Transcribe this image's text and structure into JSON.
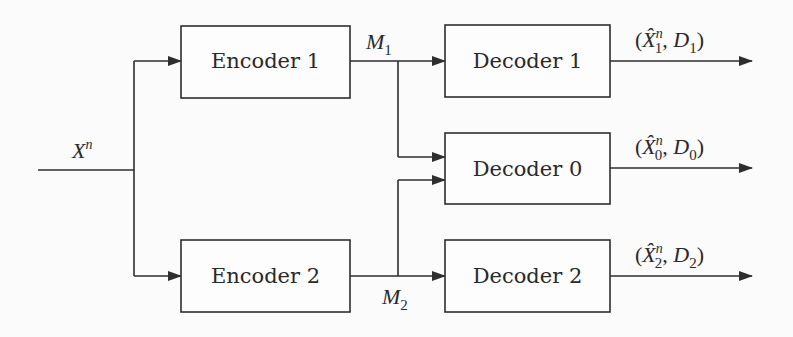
{
  "diagram": {
    "type": "multiple-description-coding block diagram",
    "input": {
      "symbol": "X",
      "superscript": "n"
    },
    "encoders": [
      {
        "id": "enc1",
        "label": "Encoder 1",
        "output": {
          "symbol": "M",
          "subscript": "1"
        }
      },
      {
        "id": "enc2",
        "label": "Encoder 2",
        "output": {
          "symbol": "M",
          "subscript": "2"
        }
      }
    ],
    "decoders": [
      {
        "id": "dec1",
        "label": "Decoder 1",
        "inputs": [
          "M1"
        ],
        "output": {
          "hat": "X̂",
          "superscript": "n",
          "subscript": "1",
          "distortion": "D",
          "distortion_subscript": "1"
        }
      },
      {
        "id": "dec0",
        "label": "Decoder 0",
        "inputs": [
          "M1",
          "M2"
        ],
        "output": {
          "hat": "X̂",
          "superscript": "n",
          "subscript": "0",
          "distortion": "D",
          "distortion_subscript": "0"
        }
      },
      {
        "id": "dec2",
        "label": "Decoder 2",
        "inputs": [
          "M2"
        ],
        "output": {
          "hat": "X̂",
          "superscript": "n",
          "subscript": "2",
          "distortion": "D",
          "distortion_subscript": "2"
        }
      }
    ],
    "colors": {
      "stroke": "#2e2e2e",
      "background": "#fbfbfb",
      "text": "#2a2a2a"
    }
  }
}
